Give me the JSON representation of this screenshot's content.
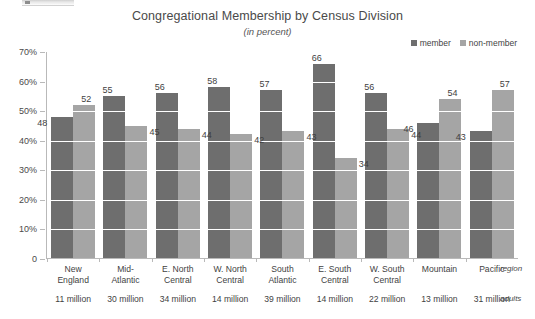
{
  "chart_data": {
    "type": "bar",
    "title": "Congregational Membership by Census Division",
    "subtitle": "(in percent)",
    "xlabel": "region",
    "ylabel": "",
    "ylim": [
      0,
      70
    ],
    "yticks": [
      "0",
      "10%",
      "20%",
      "30%",
      "40%",
      "50%",
      "60%",
      "70%"
    ],
    "ytick_values": [
      0,
      10,
      20,
      30,
      40,
      50,
      60,
      70
    ],
    "grid": true,
    "legend_position": "top-right",
    "categories": [
      "New England",
      "Mid-Atlantic",
      "E. North Central",
      "W. North Central",
      "South Atlantic",
      "E. South Central",
      "W. South Central",
      "Mountain",
      "Pacific"
    ],
    "category_lines": [
      [
        "New",
        "England"
      ],
      [
        "Mid-",
        "Atlantic"
      ],
      [
        "E. North",
        "Central"
      ],
      [
        "W. North",
        "Central"
      ],
      [
        "South",
        "Atlantic"
      ],
      [
        "E. South",
        "Central"
      ],
      [
        "W. South",
        "Central"
      ],
      [
        "Mountain",
        ""
      ],
      [
        "Pacific",
        ""
      ]
    ],
    "secondary_axis_label": "adults",
    "adults": [
      "11 million",
      "30 million",
      "34 million",
      "14 million",
      "39 million",
      "14 million",
      "22 million",
      "13 million",
      "31 million"
    ],
    "series": [
      {
        "name": "member",
        "color": "#6e6e6e",
        "values": [
          48,
          55,
          56,
          58,
          57,
          66,
          56,
          46,
          43
        ]
      },
      {
        "name": "non-member",
        "color": "#a5a5a5",
        "values": [
          52,
          45,
          44,
          42,
          43,
          34,
          44,
          54,
          57
        ]
      }
    ]
  },
  "legend": {
    "items": [
      {
        "label": "member",
        "color": "#6e6e6e"
      },
      {
        "label": "non-member",
        "color": "#a5a5a5"
      }
    ]
  }
}
